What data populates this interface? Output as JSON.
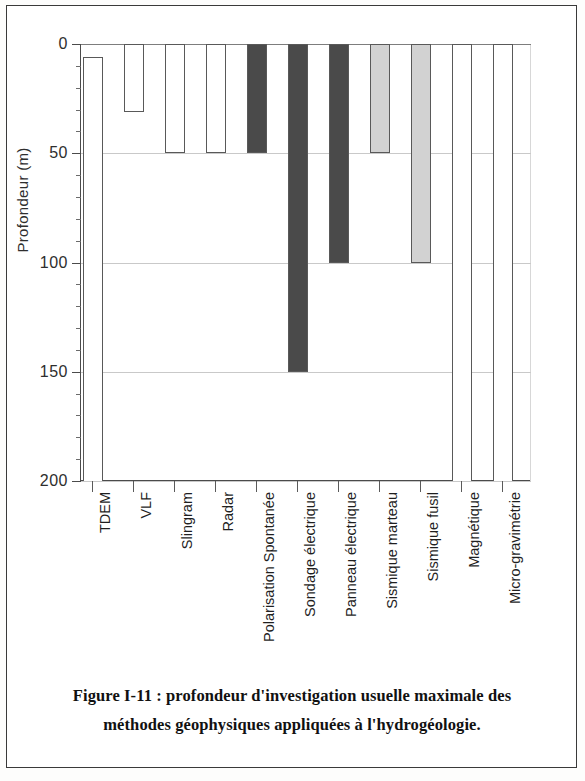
{
  "figure": {
    "caption_line1": "Figure I-11 : profondeur d'investigation usuelle maximale des",
    "caption_line2": "méthodes géophysiques appliquées à l'hydrogéologie."
  },
  "chart_data": {
    "type": "bar",
    "title": "",
    "subtitle": "",
    "orientation": "vertical",
    "inverted_y": true,
    "xlabel": "",
    "ylabel": "Profondeur (m)",
    "ylim": [
      0,
      200
    ],
    "ytick_labels": [
      "0",
      "50",
      "100",
      "150",
      "200"
    ],
    "ytick_values": [
      0,
      50,
      100,
      150,
      200
    ],
    "minor_tick_interval": 10,
    "grid": "horizontal",
    "legend": "none",
    "categories": [
      "TDEM",
      "VLF",
      "Slingram",
      "Radar",
      "Polarisation Spontanée",
      "Sondage électrique",
      "Panneau électrique",
      "Sismique marteau",
      "Sismique fusil",
      "Magnétique",
      "Micro-gravimétrie"
    ],
    "bar_start_values": [
      6,
      0,
      0,
      0,
      0,
      0,
      0,
      0,
      0,
      0,
      0
    ],
    "values": [
      200,
      31,
      50,
      50,
      50,
      150,
      100,
      50,
      100,
      200,
      200
    ],
    "bar_colors": [
      "#ffffff",
      "#ffffff",
      "#ffffff",
      "#ffffff",
      "#4a4a4a",
      "#4a4a4a",
      "#4a4a4a",
      "#d2d2d2",
      "#d2d2d2",
      "#ffffff",
      "#ffffff"
    ],
    "bar_edge_color": "#595959"
  }
}
